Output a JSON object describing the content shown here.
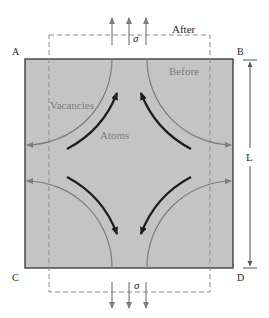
{
  "diagram": {
    "corners": {
      "top_left": "A",
      "top_right": "B",
      "bottom_left": "C",
      "bottom_right": "D"
    },
    "labels": {
      "after": "After",
      "before": "Before",
      "vacancies": "Vacancies",
      "atoms": "Atoms",
      "length": "L",
      "stress_top": "σ",
      "stress_bottom": "σ"
    },
    "colors": {
      "square_fill": "#c4c4c4",
      "square_edge": "#4a4a4a",
      "vacancy_arrow": "#7d7d7d",
      "atom_arrow": "#1e1e1e",
      "dashed_outline": "#8a8a8a",
      "stress_arrow": "#7d7d7d"
    },
    "stress_arrows": {
      "top_count": 3,
      "bottom_count": 3,
      "direction_top": "up",
      "direction_bottom": "down"
    }
  }
}
